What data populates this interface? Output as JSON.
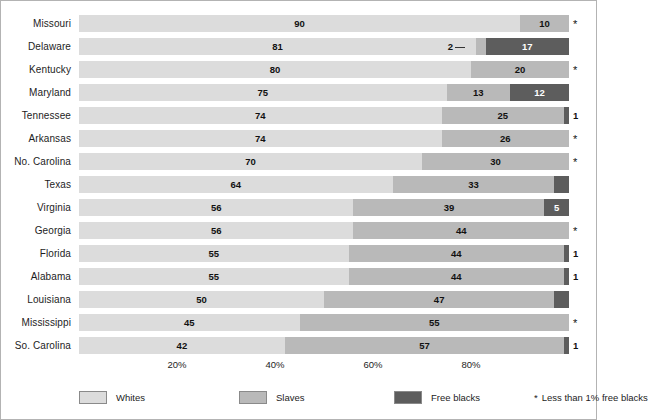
{
  "chart_data": {
    "type": "bar",
    "orientation": "horizontal",
    "stacked": true,
    "normalized_percent": true,
    "title": "",
    "subtitle": "",
    "xlabel": "",
    "ylabel": "",
    "xlim": [
      0,
      100
    ],
    "grid": false,
    "legend_position": "bottom",
    "categories": [
      "Missouri",
      "Delaware",
      "Kentucky",
      "Maryland",
      "Tennessee",
      "Arkansas",
      "No. Carolina",
      "Texas",
      "Virginia",
      "Georgia",
      "Florida",
      "Alabama",
      "Louisiana",
      "Mississippi",
      "So. Carolina"
    ],
    "series": [
      {
        "name": "Whites",
        "color": "#dcdcdc",
        "values": [
          90,
          81,
          80,
          75,
          74,
          74,
          70,
          64,
          56,
          56,
          55,
          55,
          50,
          45,
          42
        ]
      },
      {
        "name": "Slaves",
        "color": "#b9b9b9",
        "values": [
          10,
          2,
          20,
          13,
          25,
          26,
          30,
          33,
          39,
          44,
          44,
          44,
          47,
          55,
          57
        ]
      },
      {
        "name": "Free blacks",
        "color": "#5d5d5d",
        "values": [
          0,
          17,
          0,
          12,
          1,
          0,
          0,
          3,
          5,
          0,
          1,
          1,
          3,
          0,
          1
        ]
      }
    ],
    "xticks": [
      20,
      40,
      60,
      80
    ],
    "xticklabels": [
      "20%",
      "40%",
      "60%",
      "80%"
    ],
    "annotations": {
      "asterisk_symbol": "*",
      "asterisk_rows": [
        "Missouri",
        "Kentucky",
        "Arkansas",
        "No. Carolina",
        "Georgia",
        "Mississippi"
      ],
      "callout_rows": [
        "Delaware"
      ]
    }
  },
  "rows": [
    {
      "label": "Missouri",
      "whites": "90",
      "slaves": "10",
      "free": "",
      "free_outside": "",
      "marker": "*",
      "callout": false
    },
    {
      "label": "Delaware",
      "whites": "81",
      "slaves": "2",
      "free": "17",
      "free_outside": "",
      "marker": "",
      "callout": true
    },
    {
      "label": "Kentucky",
      "whites": "80",
      "slaves": "20",
      "free": "",
      "free_outside": "",
      "marker": "*",
      "callout": false
    },
    {
      "label": "Maryland",
      "whites": "75",
      "slaves": "13",
      "free": "12",
      "free_outside": "",
      "marker": "",
      "callout": false
    },
    {
      "label": "Tennessee",
      "whites": "74",
      "slaves": "25",
      "free": "",
      "free_outside": "1",
      "marker": "",
      "callout": false
    },
    {
      "label": "Arkansas",
      "whites": "74",
      "slaves": "26",
      "free": "",
      "free_outside": "",
      "marker": "*",
      "callout": false
    },
    {
      "label": "No. Carolina",
      "whites": "70",
      "slaves": "30",
      "free": "",
      "free_outside": "",
      "marker": "*",
      "callout": false
    },
    {
      "label": "Texas",
      "whites": "64",
      "slaves": "33",
      "free": "3",
      "free_outside": "",
      "marker": "",
      "callout": false
    },
    {
      "label": "Virginia",
      "whites": "56",
      "slaves": "39",
      "free": "5",
      "free_outside": "",
      "marker": "",
      "callout": false
    },
    {
      "label": "Georgia",
      "whites": "56",
      "slaves": "44",
      "free": "",
      "free_outside": "",
      "marker": "*",
      "callout": false
    },
    {
      "label": "Florida",
      "whites": "55",
      "slaves": "44",
      "free": "",
      "free_outside": "1",
      "marker": "",
      "callout": false
    },
    {
      "label": "Alabama",
      "whites": "55",
      "slaves": "44",
      "free": "",
      "free_outside": "1",
      "marker": "",
      "callout": false
    },
    {
      "label": "Louisiana",
      "whites": "50",
      "slaves": "47",
      "free": "3",
      "free_outside": "",
      "marker": "",
      "callout": false
    },
    {
      "label": "Mississippi",
      "whites": "45",
      "slaves": "55",
      "free": "",
      "free_outside": "",
      "marker": "*",
      "callout": false
    },
    {
      "label": "So. Carolina",
      "whites": "42",
      "slaves": "57",
      "free": "",
      "free_outside": "1",
      "marker": "",
      "callout": false
    }
  ],
  "axis": {
    "ticks": [
      {
        "label": "20%",
        "value": 20
      },
      {
        "label": "40%",
        "value": 40
      },
      {
        "label": "60%",
        "value": 60
      },
      {
        "label": "80%",
        "value": 80
      }
    ]
  },
  "legend": {
    "items": [
      {
        "label": "Whites",
        "color": "#dcdcdc"
      },
      {
        "label": "Slaves",
        "color": "#b9b9b9"
      },
      {
        "label": "Free blacks",
        "color": "#5d5d5d"
      }
    ],
    "note_symbol": "*",
    "note_text": "Less than 1% free blacks"
  },
  "delaware_callout": {
    "value": "2"
  }
}
